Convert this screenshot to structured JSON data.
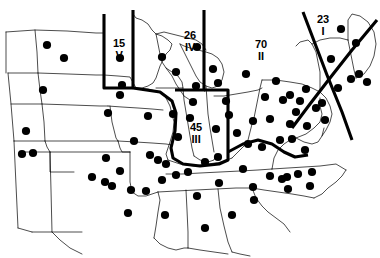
{
  "figure": {
    "type": "map",
    "title": "",
    "background_color": "#ffffff",
    "line_color": "#000000",
    "marker_color": "#000000",
    "width": 380,
    "height": 258
  },
  "regions": [
    {
      "id": "region-v",
      "count": "15",
      "roman": "V",
      "label_x": 113,
      "label_y": 38
    },
    {
      "id": "region-iv",
      "count": "26",
      "roman": "IV",
      "label_x": 184,
      "label_y": 30
    },
    {
      "id": "region-ii",
      "count": "70",
      "roman": "II",
      "label_x": 255,
      "label_y": 39
    },
    {
      "id": "region-i",
      "count": "23",
      "roman": "I",
      "label_x": 317,
      "label_y": 14
    },
    {
      "id": "region-iii",
      "count": "45",
      "roman": "III",
      "label_x": 190,
      "label_y": 122
    }
  ],
  "dividers": [
    {
      "id": "divider-west-v",
      "path": "M 104 14 L 104 73 L 104 88 L 133 88"
    },
    {
      "id": "divider-east-v",
      "path": "M 133 10 L 133 88"
    },
    {
      "id": "divider-iv-ii",
      "path": "M 204 10 L 204 90 L 175 90"
    },
    {
      "id": "divider-ii-iii",
      "path": "M 133 88 L 160 92 L 172 101 L 176 113 L 175 131 L 171 148 L 173 158 L 183 164 L 200 166 L 219 164 L 228 160 L 228 121 L 228 90 L 204 90"
    },
    {
      "id": "divider-iii-east",
      "path": "M 228 152 L 243 144 L 258 140 L 272 144 L 284 152 L 295 157 L 308 155"
    },
    {
      "id": "divider-i-west",
      "path": "M 303 12 L 327 75 L 342 112 L 352 140"
    },
    {
      "id": "divider-i-coast",
      "path": "M 377 20 L 352 50 L 330 78 L 310 104 L 292 128"
    }
  ],
  "borders": [
    {
      "id": "border-outline-west",
      "path": "M 6 32 L 35 30 L 67 31 L 96 33 L 104 33"
    },
    {
      "id": "border-outline-nd-sd",
      "path": "M 8 73 L 38 73 L 68 74 L 96 75 L 104 75"
    },
    {
      "id": "border-sd-ne",
      "path": "M 11 104 L 42 104 L 72 105 L 100 106 L 108 106"
    },
    {
      "id": "border-ne-ks",
      "path": "M 14 141 L 45 141 L 75 141 L 103 141 L 118 141"
    },
    {
      "id": "border-ks-ok",
      "path": "M 21 152 L 50 152 L 80 152 L 112 152 L 130 152"
    },
    {
      "id": "border-ok-tx",
      "path": "M 32 232 L 58 232 L 82 232"
    },
    {
      "id": "border-mt-wy-vert",
      "path": "M 6 32 L 6 73"
    },
    {
      "id": "border-wy-co-vert",
      "path": "M 8 73 L 11 104 L 14 141"
    },
    {
      "id": "border-co-nm-vert",
      "path": "M 14 141 L 16 185 L 18 228"
    },
    {
      "id": "border-nm-tx-vert",
      "path": "M 18 228 L 32 232"
    },
    {
      "id": "border-mt-nd-vert",
      "path": "M 35 30 L 37 52 L 38 73"
    },
    {
      "id": "border-nd-sd-vert",
      "path": "M 38 73 L 40 90 L 42 104"
    },
    {
      "id": "border-sd-ne-vert",
      "path": "M 42 104 L 44 122 L 45 141"
    },
    {
      "id": "border-ne-ks-vert",
      "path": "M 45 141 L 47 147 L 50 152"
    },
    {
      "id": "border-ks-ok-vert",
      "path": "M 50 152 L 51 190 L 52 232"
    },
    {
      "id": "border-ok-panhandle",
      "path": "M 50 152 L 50 172 L 74 172"
    },
    {
      "id": "border-mn-nd",
      "path": "M 104 33 L 104 75"
    },
    {
      "id": "border-mn-shape",
      "path": "M 133 14 L 136 18 L 142 20 L 148 24 L 152 30 L 156 34 L 162 36 L 168 40 L 172 44 L 170 50 L 166 54 L 163 60 L 160 66 L 158 72 L 156 78 L 153 83 L 148 86 L 142 88 L 136 88 L 133 88"
    },
    {
      "id": "border-mn-sd-ia",
      "path": "M 104 75 L 118 76 L 130 77 L 136 88"
    },
    {
      "id": "border-ia-north",
      "path": "M 104 88 L 120 88 L 133 88 L 148 89 L 160 92"
    },
    {
      "id": "border-ia-south",
      "path": "M 108 106 L 122 107 L 138 108 L 152 109 L 163 110"
    },
    {
      "id": "border-ia-mo",
      "path": "M 110 106 L 112 122 L 116 138 L 118 141"
    },
    {
      "id": "border-mo-ar",
      "path": "M 118 141 L 136 142 L 152 143 L 166 144 L 172 145"
    },
    {
      "id": "border-ar-la",
      "path": "M 130 152 L 130 182 L 132 192 L 138 196 L 146 196 L 152 194 L 158 192"
    },
    {
      "id": "border-ar-ms",
      "path": "M 158 192 L 160 200 L 158 212 L 156 226 L 154 238"
    },
    {
      "id": "border-mo-il",
      "path": "M 160 92 L 166 98 L 170 106 L 172 114 L 174 122 L 173 132 L 170 142 L 168 148 L 166 154 L 168 160"
    },
    {
      "id": "border-il-in",
      "path": "M 183 88 L 184 100 L 186 112 L 188 124 L 190 136 L 192 148 L 194 156"
    },
    {
      "id": "border-in-oh",
      "path": "M 206 86 L 207 100 L 208 114 L 210 128 L 212 140 L 214 152"
    },
    {
      "id": "border-il-ky",
      "path": "M 168 160 L 180 164 L 194 166 L 208 164 L 222 162 L 232 158"
    },
    {
      "id": "border-ky-tn",
      "path": "M 166 174 L 182 174 L 200 173 L 220 172 L 240 171 L 258 170 L 272 169"
    },
    {
      "id": "border-tn-ms-al",
      "path": "M 158 192 L 176 191 L 196 190 L 216 189 L 236 188 L 252 188"
    },
    {
      "id": "border-ms-al-vert",
      "path": "M 186 190 L 187 210 L 188 232 L 188 248"
    },
    {
      "id": "border-al-ga-vert",
      "path": "M 218 189 L 220 208 L 224 226 L 228 242 L 232 252"
    },
    {
      "id": "border-ga-sc",
      "path": "M 252 188 L 256 198 L 262 206 L 268 212 L 276 218 L 284 224 L 290 232"
    },
    {
      "id": "border-sc-nc",
      "path": "M 252 188 L 264 190 L 278 192 L 292 194 L 304 196 L 314 198"
    },
    {
      "id": "border-nc-coast",
      "path": "M 314 198 L 322 194 L 328 188 L 336 182 L 342 176 L 346 170"
    },
    {
      "id": "border-nc-va",
      "path": "M 272 169 L 288 168 L 304 167 L 320 166 L 336 164 L 346 170"
    },
    {
      "id": "border-va-wv",
      "path": "M 272 169 L 274 158 L 278 150 L 284 144 L 290 140 L 296 138"
    },
    {
      "id": "border-wv-oh",
      "path": "M 232 158 L 238 152 L 244 146 L 248 140 L 250 132 L 252 124 L 254 118"
    },
    {
      "id": "border-oh-pa",
      "path": "M 254 118 L 256 108 L 258 98 L 260 88 L 262 80"
    },
    {
      "id": "border-oh-lake",
      "path": "M 214 96 L 224 96 L 236 94 L 248 92 L 258 90 L 262 88"
    },
    {
      "id": "border-pa-ny",
      "path": "M 262 80 L 276 80 L 290 82 L 302 84 L 312 88 L 320 92"
    },
    {
      "id": "border-pa-md",
      "path": "M 296 138 L 306 134 L 314 128 L 320 122 L 322 114 L 320 106 L 320 98"
    },
    {
      "id": "border-md-de",
      "path": "M 296 138 L 304 142 L 312 144 L 318 142 L 322 136 L 324 128"
    },
    {
      "id": "border-nj",
      "path": "M 320 92 L 326 98 L 330 106 L 332 114 L 330 122 L 326 130 L 322 136"
    },
    {
      "id": "border-ny-north",
      "path": "M 312 44 L 320 40 L 330 38 L 340 38 L 348 40"
    },
    {
      "id": "border-ny-shape",
      "path": "M 296 46 L 300 42 L 308 40 L 312 44 L 316 52 L 318 62 L 320 72 L 320 84 L 320 92"
    },
    {
      "id": "border-ny-vt-nh",
      "path": "M 348 40 L 350 50 L 352 60 L 354 70 L 356 78"
    },
    {
      "id": "border-ne-coast",
      "path": "M 356 78 L 364 74 L 370 66 L 374 56 L 376 44 L 374 32 L 368 22 L 360 16 L 352 14 L 348 20 L 348 30 L 348 40"
    },
    {
      "id": "border-mi-lower",
      "path": "M 180 44 L 184 52 L 188 60 L 192 68 L 196 76 L 200 82 L 206 86 L 212 88 L 218 86 L 222 80 L 224 72 L 222 64 L 218 58 L 212 54 L 206 52 L 198 50 L 190 48 L 184 46 L 180 44"
    },
    {
      "id": "border-mi-upper",
      "path": "M 156 34 L 164 32 L 172 34 L 180 36 L 188 38 L 196 40 L 202 44 L 206 50"
    },
    {
      "id": "border-wi-shape",
      "path": "M 156 34 L 158 44 L 160 54 L 162 62 L 166 68 L 172 72 L 178 76 L 182 82 L 183 88 L 170 88 L 156 88"
    },
    {
      "id": "border-lake-mi",
      "path": "M 166 68 L 172 76 L 176 84 L 180 90 L 184 96 L 190 100"
    },
    {
      "id": "border-in-il-s",
      "path": "M 194 156 L 200 160 L 208 162 L 214 160 L 216 154"
    },
    {
      "id": "border-mo-ks-vert",
      "path": "M 118 141 L 120 148 L 122 152 L 130 152"
    },
    {
      "id": "border-tx-coast",
      "path": "M 52 232 L 60 240 L 70 248 L 82 254"
    },
    {
      "id": "border-la-gulf",
      "path": "M 154 238 L 160 244 L 168 248 L 176 250 L 184 248 L 188 248"
    },
    {
      "id": "border-fl-ga",
      "path": "M 232 252 L 240 254 L 250 256"
    },
    {
      "id": "border-ga-fl-line",
      "path": "M 188 248 L 200 250 L 214 252 L 228 254"
    }
  ],
  "dots": [
    {
      "x": 47,
      "y": 45
    },
    {
      "x": 64,
      "y": 58
    },
    {
      "x": 43,
      "y": 90
    },
    {
      "x": 120,
      "y": 58
    },
    {
      "x": 162,
      "y": 57
    },
    {
      "x": 197,
      "y": 47
    },
    {
      "x": 176,
      "y": 72
    },
    {
      "x": 213,
      "y": 69
    },
    {
      "x": 246,
      "y": 74
    },
    {
      "x": 276,
      "y": 81
    },
    {
      "x": 290,
      "y": 95
    },
    {
      "x": 306,
      "y": 89
    },
    {
      "x": 322,
      "y": 103
    },
    {
      "x": 338,
      "y": 88
    },
    {
      "x": 351,
      "y": 79
    },
    {
      "x": 359,
      "y": 74
    },
    {
      "x": 367,
      "y": 82
    },
    {
      "x": 341,
      "y": 29
    },
    {
      "x": 356,
      "y": 43
    },
    {
      "x": 331,
      "y": 59
    },
    {
      "x": 122,
      "y": 85
    },
    {
      "x": 120,
      "y": 95
    },
    {
      "x": 196,
      "y": 86
    },
    {
      "x": 218,
      "y": 83
    },
    {
      "x": 265,
      "y": 97
    },
    {
      "x": 283,
      "y": 100
    },
    {
      "x": 300,
      "y": 101
    },
    {
      "x": 193,
      "y": 102
    },
    {
      "x": 226,
      "y": 101
    },
    {
      "x": 296,
      "y": 112
    },
    {
      "x": 316,
      "y": 108
    },
    {
      "x": 26,
      "y": 131
    },
    {
      "x": 108,
      "y": 113
    },
    {
      "x": 148,
      "y": 116
    },
    {
      "x": 173,
      "y": 114
    },
    {
      "x": 190,
      "y": 118
    },
    {
      "x": 229,
      "y": 115
    },
    {
      "x": 253,
      "y": 121
    },
    {
      "x": 270,
      "y": 119
    },
    {
      "x": 290,
      "y": 124
    },
    {
      "x": 307,
      "y": 126
    },
    {
      "x": 325,
      "y": 120
    },
    {
      "x": 22,
      "y": 154
    },
    {
      "x": 33,
      "y": 153
    },
    {
      "x": 178,
      "y": 137
    },
    {
      "x": 216,
      "y": 129
    },
    {
      "x": 237,
      "y": 133
    },
    {
      "x": 248,
      "y": 144
    },
    {
      "x": 262,
      "y": 147
    },
    {
      "x": 280,
      "y": 140
    },
    {
      "x": 292,
      "y": 139
    },
    {
      "x": 305,
      "y": 150
    },
    {
      "x": 106,
      "y": 158
    },
    {
      "x": 134,
      "y": 141
    },
    {
      "x": 131,
      "y": 190
    },
    {
      "x": 146,
      "y": 191
    },
    {
      "x": 112,
      "y": 186
    },
    {
      "x": 162,
      "y": 180
    },
    {
      "x": 176,
      "y": 175
    },
    {
      "x": 188,
      "y": 172
    },
    {
      "x": 243,
      "y": 169
    },
    {
      "x": 270,
      "y": 176
    },
    {
      "x": 282,
      "y": 179
    },
    {
      "x": 287,
      "y": 177
    },
    {
      "x": 298,
      "y": 174
    },
    {
      "x": 312,
      "y": 172
    },
    {
      "x": 253,
      "y": 187
    },
    {
      "x": 288,
      "y": 189
    },
    {
      "x": 310,
      "y": 186
    },
    {
      "x": 197,
      "y": 196
    },
    {
      "x": 219,
      "y": 183
    },
    {
      "x": 128,
      "y": 213
    },
    {
      "x": 165,
      "y": 215
    },
    {
      "x": 254,
      "y": 200
    },
    {
      "x": 232,
      "y": 215
    },
    {
      "x": 205,
      "y": 228
    },
    {
      "x": 120,
      "y": 171
    },
    {
      "x": 92,
      "y": 177
    },
    {
      "x": 105,
      "y": 182
    },
    {
      "x": 150,
      "y": 155
    },
    {
      "x": 158,
      "y": 160
    },
    {
      "x": 166,
      "y": 164
    },
    {
      "x": 218,
      "y": 157
    },
    {
      "x": 205,
      "y": 162
    }
  ]
}
